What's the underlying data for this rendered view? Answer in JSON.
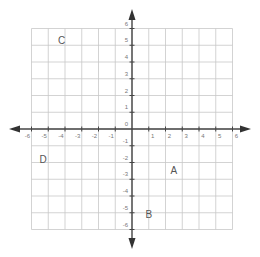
{
  "graph": {
    "x_range": [
      -6,
      6
    ],
    "y_range": [
      -6,
      6
    ],
    "grid_step": 1,
    "colors": {
      "grid": "#c8c8c8",
      "axis": "#444444",
      "tick_label": "#777777",
      "point_label": "#555555"
    },
    "x_tick_labels": [
      "-6",
      "-5",
      "-4",
      "-3",
      "-2",
      "-1",
      "1",
      "2",
      "3",
      "4",
      "5",
      "6"
    ],
    "y_tick_labels": [
      "6",
      "5",
      "4",
      "3",
      "2",
      "1",
      "0",
      "-1",
      "-2",
      "-3",
      "-4",
      "-5",
      "-6"
    ],
    "points": [
      {
        "label": "A",
        "x": 2.5,
        "y": -2.5
      },
      {
        "label": "B",
        "x": 1,
        "y": -5.1
      },
      {
        "label": "C",
        "x": -4.2,
        "y": 5.3
      },
      {
        "label": "D",
        "x": -5.3,
        "y": -1.8
      }
    ]
  }
}
